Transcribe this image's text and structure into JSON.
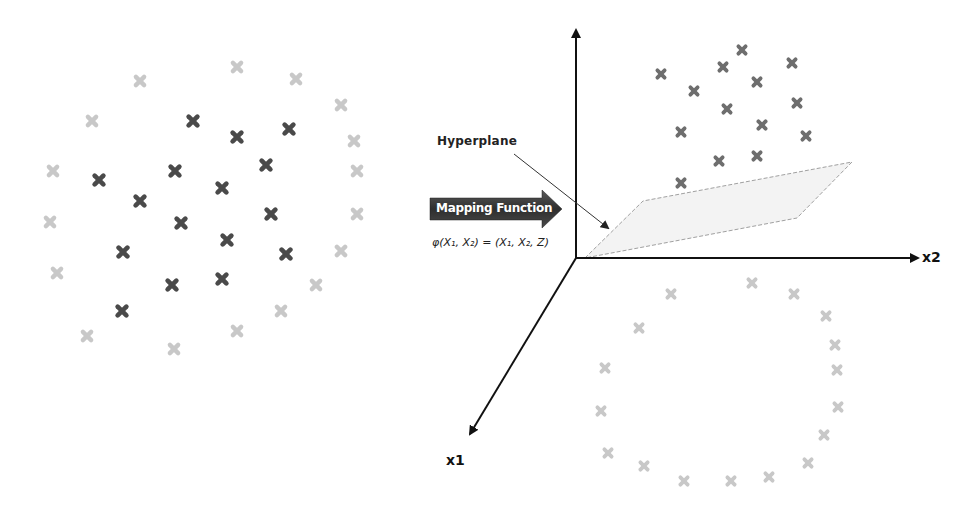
{
  "diagram": {
    "labels": {
      "hyperplane": "Hyperplane",
      "mapping_function": "Mapping Function",
      "formula": "φ(X₁, X₂) = (X₁, X₂, Z)",
      "axis_x1": "x1",
      "axis_x2": "x2"
    },
    "colors": {
      "dark_marker": "#4a4a4a",
      "light_marker": "#c8c8c8",
      "mid_marker": "#6e6e6e",
      "axis": "#111111",
      "plane_fill": "#f2f2f2",
      "plane_stroke": "#9a9a9a",
      "arrow_fill": "#3a3a3a"
    },
    "left_plot": {
      "description": "2D input space: dark class clustered in center, light class surrounding in ring",
      "dark_points": [
        [
          193,
          121
        ],
        [
          237,
          137
        ],
        [
          289,
          129
        ],
        [
          99,
          180
        ],
        [
          175,
          171
        ],
        [
          266,
          165
        ],
        [
          140,
          201
        ],
        [
          222,
          188
        ],
        [
          181,
          223
        ],
        [
          271,
          214
        ],
        [
          123,
          252
        ],
        [
          227,
          240
        ],
        [
          286,
          254
        ],
        [
          172,
          285
        ],
        [
          222,
          279
        ],
        [
          122,
          311
        ]
      ],
      "light_points": [
        [
          140,
          81
        ],
        [
          237,
          67
        ],
        [
          296,
          79
        ],
        [
          92,
          121
        ],
        [
          341,
          105
        ],
        [
          354,
          141
        ],
        [
          53,
          171
        ],
        [
          357,
          171
        ],
        [
          50,
          222
        ],
        [
          357,
          214
        ],
        [
          57,
          273
        ],
        [
          341,
          251
        ],
        [
          316,
          285
        ],
        [
          87,
          336
        ],
        [
          281,
          311
        ],
        [
          237,
          331
        ],
        [
          174,
          349
        ]
      ]
    },
    "right_plot": {
      "description": "3D feature space: dark class lifted above hyperplane, light class ring below",
      "origin": [
        576,
        258
      ],
      "upper_points": [
        [
          742,
          50
        ],
        [
          661,
          74
        ],
        [
          723,
          67
        ],
        [
          792,
          63
        ],
        [
          694,
          91
        ],
        [
          757,
          82
        ],
        [
          727,
          109
        ],
        [
          797,
          103
        ],
        [
          681,
          132
        ],
        [
          762,
          125
        ],
        [
          806,
          136
        ],
        [
          719,
          161
        ],
        [
          757,
          156
        ],
        [
          681,
          183
        ]
      ],
      "lower_points": [
        [
          752,
          283
        ],
        [
          671,
          294
        ],
        [
          794,
          294
        ],
        [
          639,
          328
        ],
        [
          826,
          316
        ],
        [
          835,
          345
        ],
        [
          605,
          368
        ],
        [
          837,
          370
        ],
        [
          601,
          411
        ],
        [
          838,
          407
        ],
        [
          608,
          453
        ],
        [
          824,
          435
        ],
        [
          644,
          466
        ],
        [
          808,
          463
        ],
        [
          684,
          481
        ],
        [
          731,
          481
        ],
        [
          769,
          477
        ]
      ]
    }
  }
}
